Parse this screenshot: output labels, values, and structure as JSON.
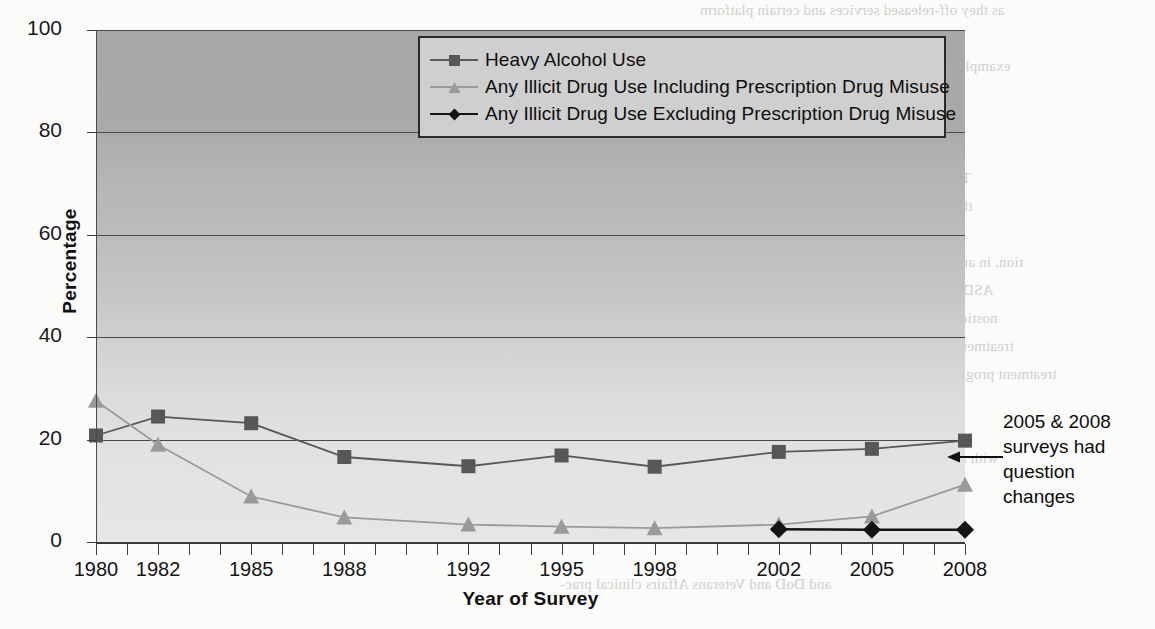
{
  "chart_data": {
    "type": "line",
    "title": "",
    "xlabel": "Year of Survey",
    "ylabel": "Percentage",
    "ylim": [
      0,
      100
    ],
    "ytick_labels": [
      "0",
      "20",
      "40",
      "60",
      "80",
      "100"
    ],
    "ytick_values": [
      0,
      20,
      40,
      60,
      80,
      100
    ],
    "grid": true,
    "legend_position": "top-center",
    "x_axis_min": 1980,
    "x_axis_max": 2008,
    "categories": [
      1980,
      1982,
      1985,
      1988,
      1992,
      1995,
      1998,
      2002,
      2005,
      2008
    ],
    "xtick_labels": [
      "1980",
      "1982",
      "1985",
      "1988",
      "1992",
      "1995",
      "1998",
      "2002",
      "2005",
      "2008"
    ],
    "series": [
      {
        "name": "Heavy Alcohol Use",
        "marker": "square",
        "color": "#575757",
        "x": [
          1980,
          1982,
          1985,
          1988,
          1992,
          1995,
          1998,
          2002,
          2005,
          2008
        ],
        "values": [
          20.8,
          24.5,
          23.2,
          16.6,
          14.8,
          16.9,
          14.7,
          17.6,
          18.2,
          19.8
        ]
      },
      {
        "name": "Any Illicit Drug Use Including Prescription Drug Misuse",
        "marker": "triangle",
        "color": "#9a9a9a",
        "x": [
          1980,
          1982,
          1985,
          1988,
          1992,
          1995,
          1998,
          2002,
          2005,
          2008
        ],
        "values": [
          27.6,
          19.0,
          8.9,
          4.8,
          3.4,
          3.0,
          2.7,
          3.4,
          5.0,
          11.2
        ]
      },
      {
        "name": "Any Illicit Drug Use Excluding Prescription Drug Misuse",
        "marker": "diamond",
        "color": "#141414",
        "x": [
          2002,
          2005,
          2008
        ],
        "values": [
          2.5,
          2.4,
          2.4
        ]
      }
    ],
    "annotations": [
      {
        "name": "question-change-note",
        "text": "2005 & 2008 surveys had question changes",
        "lines": [
          "2005 & 2008",
          "surveys had",
          "question",
          "changes"
        ],
        "points_to": "2008 Any Illicit Drug Use Including Prescription Drug Misuse"
      }
    ]
  },
  "legend": {
    "items": [
      {
        "label": "Heavy Alcohol Use",
        "marker": "square",
        "color": "#575757"
      },
      {
        "label": "Any Illicit Drug Use Including Prescription Drug Misuse",
        "marker": "triangle",
        "color": "#9a9a9a"
      },
      {
        "label": "Any Illicit Drug Use Excluding Prescription Drug Misuse",
        "marker": "diamond",
        "color": "#141414"
      }
    ]
  },
  "axes": {
    "y_title": "Percentage",
    "x_title": "Year of Survey"
  },
  "annotation": {
    "line1": "2005 & 2008",
    "line2": "surveys had",
    "line3": "question",
    "line4": "changes"
  },
  "background_text": {
    "items": [
      "as they off-released services and certain platform",
      "related products and services. As an",
      "example, the DoD/VA policy at that time prohibited",
      "pted the assistance of a single and the result",
      "osters and different standards",
      "of supratheoptimal services and treatment",
      "The DoD Instruction established the standard",
      "themselves, for each of the services and other",
      "sur-face that a practice of substance",
      "tion, in and treatment, defined the assessment of DoD",
      "ASD/authority and treatment of SUD in the DoD",
      "nostics for different and among military members",
      "treatment can be obtained in a variety of and private",
      "treatment programs committed to discussed a legal point to",
      "identification, the treatment of assessment",
      "with as CAP Type of the alcohol or drug involved",
      "LEARNING FROM HISTORY",
      "and DoD and Veterans Affairs clinical prac-"
    ]
  }
}
